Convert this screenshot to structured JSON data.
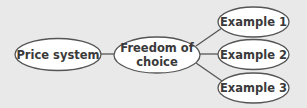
{
  "diagram": {
    "type": "concept-map",
    "colors": {
      "background": "#e9e9e9",
      "node_fill": "#ffffff",
      "node_stroke": "#555555",
      "edge_stroke": "#555555",
      "text": "#3a3a3a"
    },
    "nodes": {
      "price_system": {
        "label": "Price system"
      },
      "freedom_of_choice": {
        "label_line1": "Freedom of",
        "label_line2": "choice"
      },
      "example_1": {
        "label": "Example 1"
      },
      "example_2": {
        "label": "Example 2"
      },
      "example_3": {
        "label": "Example 3"
      }
    },
    "edges": [
      {
        "from": "Price system",
        "to": "Freedom of choice"
      },
      {
        "from": "Freedom of choice",
        "to": "Example 1"
      },
      {
        "from": "Freedom of choice",
        "to": "Example 2"
      },
      {
        "from": "Freedom of choice",
        "to": "Example 3"
      }
    ]
  }
}
